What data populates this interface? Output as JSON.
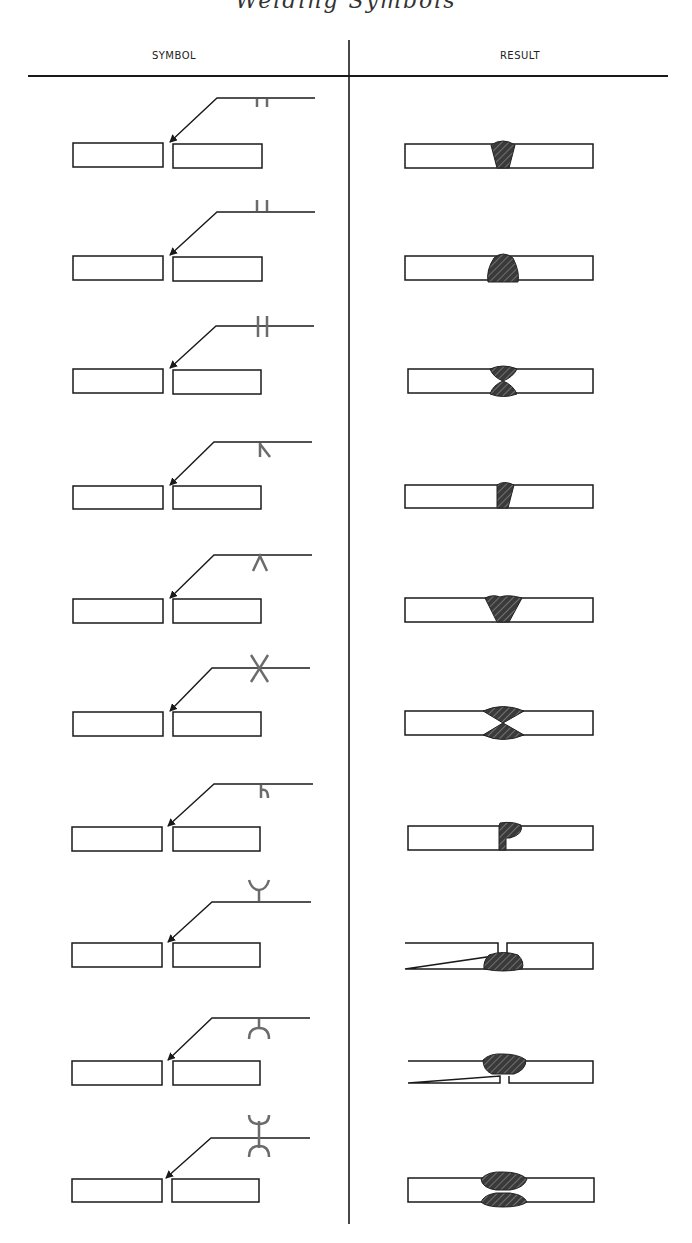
{
  "header": {
    "title_fragment": "Welding Symbols",
    "columns": {
      "symbol": "SYMBOL",
      "result": "RESULT"
    }
  },
  "colors": {
    "line": "#1a1a1a",
    "symbol_gray": "#6b6b6b",
    "weld_fill": "#3a3a3a",
    "hatch": "#8a8a8a",
    "background": "#ffffff"
  },
  "rows": [
    {
      "index": 1,
      "symbol": "square-groove-arrow-side",
      "result": "square butt weld, top"
    },
    {
      "index": 2,
      "symbol": "square-groove-other-side",
      "result": "square butt weld, bottom reinforced"
    },
    {
      "index": 3,
      "symbol": "square-groove-both-sides",
      "result": "double square butt weld"
    },
    {
      "index": 4,
      "symbol": "bevel-groove",
      "result": "single bevel weld"
    },
    {
      "index": 5,
      "symbol": "v-groove",
      "result": "single V weld"
    },
    {
      "index": 6,
      "symbol": "double-v-groove",
      "result": "double V weld"
    },
    {
      "index": 7,
      "symbol": "j-groove",
      "result": "single J weld"
    },
    {
      "index": 8,
      "symbol": "flare-v-groove",
      "result": "flare V weld, bottom"
    },
    {
      "index": 9,
      "symbol": "u-groove",
      "result": "single U weld, top"
    },
    {
      "index": 10,
      "symbol": "double-u-groove",
      "result": "double U weld"
    }
  ]
}
